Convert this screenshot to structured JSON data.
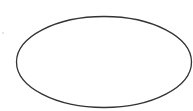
{
  "diagram": {
    "shapes": [
      {
        "type": "ellipse",
        "label": "",
        "cx": 104,
        "cy": 62,
        "rx": 87.5,
        "ry": 45.5,
        "stroke": "#333333",
        "stroke_width": 1.3,
        "fill": "#ffffff"
      }
    ]
  },
  "colors": {
    "background": "#ffffff",
    "stroke": "#333333"
  }
}
